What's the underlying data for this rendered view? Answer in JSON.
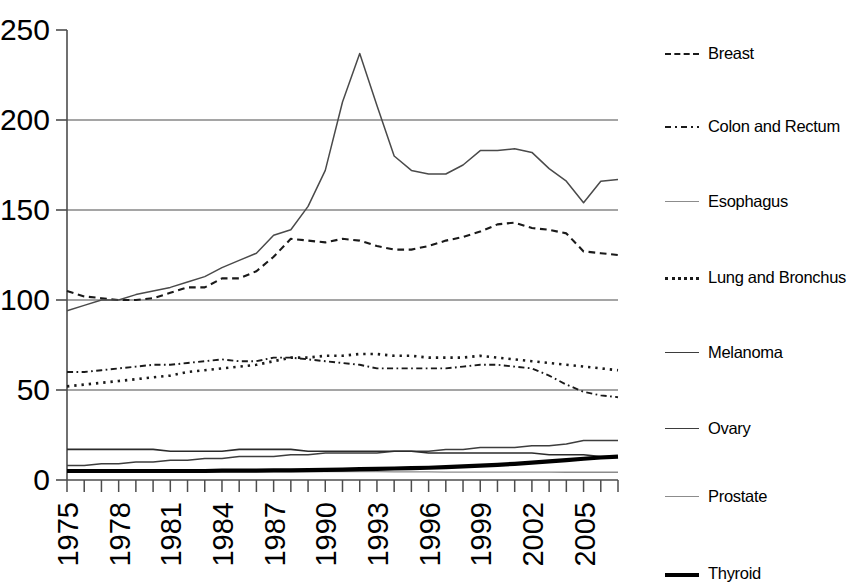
{
  "chart_data": {
    "type": "line",
    "title": "",
    "xlabel": "",
    "ylabel": "",
    "xlim": [
      1975,
      2007
    ],
    "ylim": [
      0,
      250
    ],
    "yticks": [
      0,
      50,
      100,
      150,
      200,
      250
    ],
    "ytick_labels": [
      "0",
      "50",
      "100",
      "150",
      "200",
      "250"
    ],
    "x": [
      1975,
      1976,
      1977,
      1978,
      1979,
      1980,
      1981,
      1982,
      1983,
      1984,
      1985,
      1986,
      1987,
      1988,
      1989,
      1990,
      1991,
      1992,
      1993,
      1994,
      1995,
      1996,
      1997,
      1998,
      1999,
      2000,
      2001,
      2002,
      2003,
      2004,
      2005,
      2006,
      2007
    ],
    "xtick_labels": [
      "1975",
      "1978",
      "1981",
      "1984",
      "1987",
      "1990",
      "1993",
      "1996",
      "1999",
      "2002",
      "2005"
    ],
    "xtick_values": [
      1975,
      1978,
      1981,
      1984,
      1987,
      1990,
      1993,
      1996,
      1999,
      2002,
      2005
    ],
    "grid": "horizontal",
    "legend_position": "right",
    "series": [
      {
        "name": "Breast",
        "style": "dashed",
        "color": "#1a1a1a",
        "width": 2.1,
        "values": [
          105,
          102,
          101,
          100,
          100,
          101,
          104,
          107,
          107,
          112,
          112,
          116,
          124,
          134,
          133,
          132,
          134,
          133,
          130,
          128,
          128,
          130,
          133,
          135,
          138,
          142,
          143,
          140,
          139,
          137,
          127,
          126,
          125
        ]
      },
      {
        "name": "Colon and Rectum",
        "style": "dashdot",
        "color": "#1a1a1a",
        "width": 1.9,
        "values": [
          60,
          60,
          61,
          62,
          63,
          64,
          64,
          65,
          66,
          67,
          66,
          66,
          68,
          68,
          67,
          66,
          65,
          64,
          62,
          62,
          62,
          62,
          62,
          63,
          64,
          64,
          63,
          62,
          58,
          53,
          49,
          47,
          46
        ]
      },
      {
        "name": "Esophagus",
        "style": "solid",
        "color": "#8c8c8c",
        "width": 1.3,
        "values": [
          4.5,
          4.5,
          4.5,
          4.5,
          4.5,
          4.5,
          4.5,
          4.5,
          4.5,
          4.6,
          4.6,
          4.6,
          4.6,
          4.6,
          4.6,
          4.6,
          4.6,
          4.6,
          4.6,
          4.5,
          4.5,
          4.5,
          4.4,
          4.4,
          4.4,
          4.4,
          4.4,
          4.4,
          4.4,
          4.3,
          4.3,
          4.3,
          4.3
        ]
      },
      {
        "name": "Lung and Bronchus",
        "style": "dotted",
        "color": "#1a1a1a",
        "width": 2.6,
        "values": [
          52,
          53,
          54,
          55,
          56,
          57,
          58,
          60,
          61,
          62,
          63,
          64,
          66,
          68,
          68,
          69,
          69,
          70,
          70,
          69,
          69,
          68,
          68,
          68,
          69,
          68,
          67,
          66,
          65,
          64,
          63,
          62,
          61
        ]
      },
      {
        "name": "Melanoma",
        "style": "solid",
        "color": "#3d3d3d",
        "width": 1.5,
        "values": [
          8,
          8,
          9,
          9,
          10,
          10,
          11,
          11,
          12,
          12,
          13,
          13,
          13,
          14,
          14,
          15,
          15,
          15,
          15,
          16,
          16,
          16,
          17,
          17,
          18,
          18,
          18,
          19,
          19,
          20,
          22,
          22,
          22
        ]
      },
      {
        "name": "Ovary",
        "style": "solid",
        "color": "#2b2b2b",
        "width": 1.6,
        "values": [
          17,
          17,
          17,
          17,
          17,
          17,
          16,
          16,
          16,
          16,
          17,
          17,
          17,
          17,
          16,
          16,
          16,
          16,
          16,
          16,
          16,
          15,
          15,
          15,
          15,
          15,
          15,
          15,
          14,
          14,
          14,
          13,
          13
        ]
      },
      {
        "name": "Prostate",
        "style": "solid",
        "color": "#4a4a4a",
        "width": 1.5,
        "values": [
          94,
          97,
          100,
          100,
          103,
          105,
          107,
          110,
          113,
          118,
          122,
          126,
          136,
          139,
          152,
          172,
          210,
          237,
          208,
          180,
          172,
          170,
          170,
          175,
          183,
          183,
          184,
          182,
          173,
          166,
          154,
          166,
          167
        ]
      },
      {
        "name": "Thyroid",
        "style": "solid",
        "color": "#000000",
        "width": 4.2,
        "values": [
          5,
          5,
          5,
          5,
          5,
          5,
          5,
          5,
          5,
          5.2,
          5.2,
          5.2,
          5.3,
          5.4,
          5.5,
          5.6,
          5.8,
          6,
          6.2,
          6.4,
          6.6,
          6.8,
          7.2,
          7.6,
          8,
          8.4,
          9,
          9.6,
          10.3,
          11,
          11.8,
          12.5,
          13
        ]
      }
    ]
  },
  "legend": {
    "items": [
      {
        "label": "Breast",
        "style": "dashed"
      },
      {
        "label": "Colon and Rectum",
        "style": "dashdot"
      },
      {
        "label": "Esophagus",
        "style": "solid-thin-gray"
      },
      {
        "label": "Lung and Bronchus",
        "style": "dotted"
      },
      {
        "label": "Melanoma",
        "style": "solid-thin"
      },
      {
        "label": "Ovary",
        "style": "solid-thin"
      },
      {
        "label": "Prostate",
        "style": "solid-thin-gray"
      },
      {
        "label": "Thyroid",
        "style": "solid-thick"
      }
    ]
  }
}
